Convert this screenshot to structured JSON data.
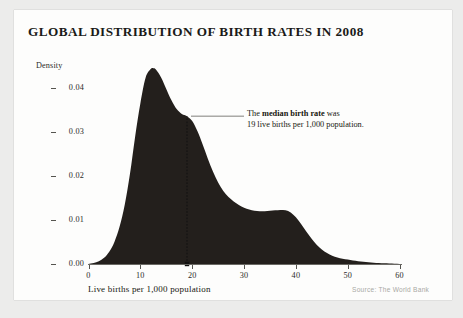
{
  "figure": {
    "title": "GLOBAL DISTRIBUTION OF BIRTH RATES IN 2008",
    "source_note": "Source: The World Bank"
  },
  "annotation": {
    "line1_prefix": "The ",
    "line1_strong": "median birth rate",
    "line1_suffix": " was",
    "line2": "19 live births per 1,000 population."
  },
  "colors": {
    "page_background": "#ececeb",
    "card_background": "#fdfdfc",
    "curve_fill": "#231f1c",
    "axis": "#55544f",
    "text": "#17170f",
    "source_text": "#a9a9a4"
  },
  "chart_data": {
    "type": "area",
    "title": "GLOBAL DISTRIBUTION OF BIRTH RATES IN 2008",
    "xlabel": "Live births per 1,000 population",
    "ylabel": "Density",
    "xlim": [
      0,
      62
    ],
    "ylim": [
      0,
      0.0465
    ],
    "grid": false,
    "legend": null,
    "xticks": [
      0,
      10,
      20,
      30,
      40,
      50,
      60
    ],
    "xtick_labels": [
      "0",
      "10",
      "20",
      "30",
      "40",
      "50",
      "60"
    ],
    "yticks": [
      0.0,
      0.01,
      0.02,
      0.03,
      0.04
    ],
    "ytick_labels": [
      "0.00",
      "0.01",
      "0.02",
      "0.03",
      "0.04"
    ],
    "series": [
      {
        "name": "Birth rate density",
        "x": [
          0,
          1,
          2,
          3,
          4,
          5,
          6,
          7,
          8,
          9,
          10,
          11,
          12,
          12.5,
          13,
          14,
          15,
          16,
          17,
          18,
          19,
          20,
          21,
          22,
          23,
          24,
          25,
          26,
          27,
          28,
          29,
          30,
          31,
          32,
          33,
          34,
          35,
          36,
          37,
          38,
          39,
          40,
          41,
          42,
          43,
          44,
          45,
          46,
          47,
          48,
          49,
          50,
          51,
          52,
          53,
          54,
          55,
          56,
          57,
          58,
          59,
          60,
          61,
          62
        ],
        "y": [
          0.0,
          0.0002,
          0.0006,
          0.0014,
          0.0028,
          0.005,
          0.0085,
          0.0135,
          0.0205,
          0.029,
          0.0365,
          0.0423,
          0.0443,
          0.0445,
          0.0442,
          0.0424,
          0.0398,
          0.0372,
          0.0352,
          0.0341,
          0.0336,
          0.0325,
          0.0302,
          0.0272,
          0.024,
          0.021,
          0.0185,
          0.0166,
          0.0152,
          0.0142,
          0.0134,
          0.0128,
          0.0124,
          0.0121,
          0.012,
          0.012,
          0.0121,
          0.0122,
          0.0123,
          0.0122,
          0.0117,
          0.0106,
          0.0091,
          0.0074,
          0.0058,
          0.0044,
          0.0033,
          0.0025,
          0.0019,
          0.0015,
          0.0012,
          0.001,
          0.0008,
          0.00065,
          0.00052,
          0.0004,
          0.0003,
          0.00022,
          0.00015,
          0.0001,
          5e-05,
          0.0,
          0.0,
          0.0
        ]
      }
    ],
    "annotations": [
      {
        "name": "median-birth-rate",
        "x": 19,
        "y_top": 0.0336,
        "marker": "square-at-axis",
        "text": "The median birth rate was 19 live births per 1,000 population.",
        "value": 19
      }
    ]
  }
}
